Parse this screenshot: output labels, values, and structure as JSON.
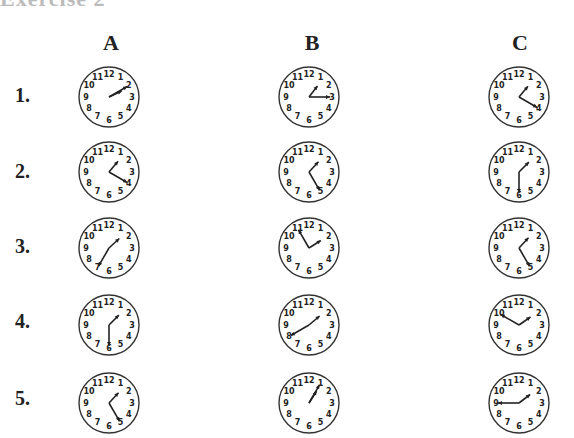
{
  "heading": "Exercise 2",
  "columns": [
    "A",
    "B",
    "C"
  ],
  "rows": [
    {
      "label": "1.",
      "clocks": [
        {
          "time": "2:10",
          "h": 2,
          "m": 10
        },
        {
          "time": "1:15",
          "h": 1,
          "m": 15
        },
        {
          "time": "1:20",
          "h": 1,
          "m": 20
        }
      ]
    },
    {
      "label": "2.",
      "clocks": [
        {
          "time": "1:20",
          "h": 1,
          "m": 20
        },
        {
          "time": "1:25",
          "h": 1,
          "m": 25
        },
        {
          "time": "1:30",
          "h": 1,
          "m": 30
        }
      ]
    },
    {
      "label": "3.",
      "clocks": [
        {
          "time": "1:35",
          "h": 1,
          "m": 35
        },
        {
          "time": "1:55",
          "h": 1,
          "m": 55
        },
        {
          "time": "1:25",
          "h": 1,
          "m": 25
        }
      ]
    },
    {
      "label": "4.",
      "clocks": [
        {
          "time": "1:30",
          "h": 1,
          "m": 30
        },
        {
          "time": "1:40",
          "h": 1,
          "m": 40
        },
        {
          "time": "1:50",
          "h": 1,
          "m": 50
        }
      ]
    },
    {
      "label": "5.",
      "clocks": [
        {
          "time": "1:25",
          "h": 1,
          "m": 25
        },
        {
          "time": "1:05",
          "h": 1,
          "m": 5
        },
        {
          "time": "1:45",
          "h": 1,
          "m": 45
        }
      ]
    }
  ],
  "dial_numbers": [
    "12",
    "1",
    "2",
    "3",
    "4",
    "5",
    "6",
    "7",
    "8",
    "9",
    "10",
    "11"
  ]
}
